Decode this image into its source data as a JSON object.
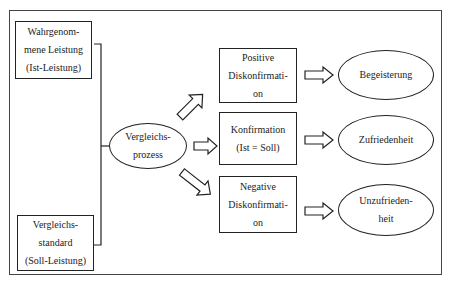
{
  "caption_fragment": "Figure fragment (cut off)",
  "inputs": [
    {
      "lines": [
        "Wahrgenom-",
        "mene Leistung",
        "(Ist-Leistung)"
      ]
    },
    {
      "lines": [
        "Vergleichs-",
        "standard",
        "(Soll-Leistung)"
      ]
    }
  ],
  "process": {
    "lines": [
      "Vergleichs-",
      "prozess"
    ]
  },
  "outcomes": [
    {
      "lines": [
        "Positive",
        "Diskonfirmati-",
        "on"
      ],
      "result": [
        "Begeisterung"
      ]
    },
    {
      "lines": [
        "Konfirmation",
        "(Ist = Soll)"
      ],
      "result": [
        "Zufriedenheit"
      ]
    },
    {
      "lines": [
        "Negative",
        "Diskonfirmati-",
        "on"
      ],
      "result": [
        "Unzufrieden-",
        "heit"
      ]
    }
  ],
  "colors": {
    "stroke": "#222222",
    "frame": "#444444",
    "background": "#ffffff"
  }
}
